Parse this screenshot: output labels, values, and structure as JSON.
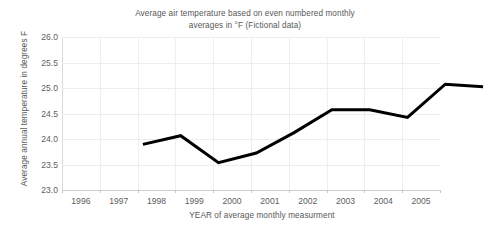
{
  "chart_data": {
    "type": "line",
    "title": "Average air temperature based on even numbered monthly averages in °F (Fictional data)",
    "title_line1": "Average air temperature based on even numbered monthly",
    "title_line2": "averages in °F (Fictional data)",
    "xlabel": "YEAR of average monthly measurment",
    "ylabel": "Average annual temperature in degrees F",
    "categories": [
      "1996",
      "1997",
      "1998",
      "1999",
      "2000",
      "2001",
      "2002",
      "2003",
      "2004",
      "2005"
    ],
    "values": [
      24.62,
      24.79,
      24.26,
      24.45,
      24.85,
      25.3,
      25.3,
      25.15,
      25.8,
      25.75
    ],
    "series": [
      {
        "name": "Average annual temperature",
        "values": [
          24.62,
          24.79,
          24.26,
          24.45,
          24.85,
          25.3,
          25.3,
          25.15,
          25.8,
          25.75
        ]
      }
    ],
    "ylim": [
      23.0,
      26.0
    ],
    "ytick_labels": [
      "26.0",
      "25.5",
      "25.0",
      "24.5",
      "24.0",
      "23.5",
      "23.0"
    ],
    "ytick_values": [
      26.0,
      25.5,
      25.0,
      24.5,
      24.0,
      23.5,
      23.0
    ],
    "grid": true,
    "legend": "none",
    "line_color": "#000000",
    "grid_color": "#ededed",
    "text_color": "#585858",
    "background_color": "#ffffff"
  }
}
